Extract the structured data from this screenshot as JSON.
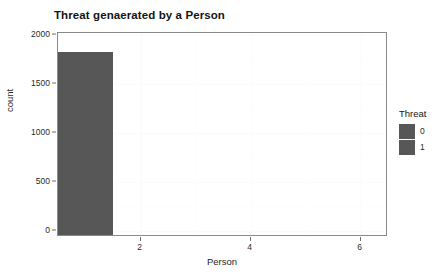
{
  "chart_data": {
    "type": "bar",
    "title": "Threat genaerated by a Person",
    "xlabel": "Person",
    "ylabel": "count",
    "xlim": [
      0.5,
      6.5
    ],
    "ylim": [
      0,
      2000
    ],
    "grid": true,
    "legend_position": "right",
    "legend_title": "Threat",
    "x_ticks": [
      "2",
      "4",
      "6"
    ],
    "x_tick_values": [
      2,
      4,
      6
    ],
    "y_ticks": [
      "0",
      "500",
      "1000",
      "1500",
      "2000"
    ],
    "y_tick_values": [
      0,
      500,
      1000,
      1500,
      2000
    ],
    "categories": [
      1,
      2,
      3,
      4,
      5,
      6
    ],
    "series": [
      {
        "name": "0",
        "color": "#575757",
        "values": [
          1930,
          50,
          0,
          0,
          0,
          8
        ]
      },
      {
        "name": "1",
        "color": "#575757",
        "values": [
          0,
          0,
          0,
          0,
          0,
          0
        ]
      }
    ],
    "bars": [
      {
        "x_center": 1,
        "width": 1,
        "value": 1930,
        "color": "#575757",
        "faint": false
      },
      {
        "x_center": 2,
        "width": 1,
        "value": 50,
        "color": "#575757",
        "faint": false
      },
      {
        "x_center": 6,
        "width": 1,
        "value": 8,
        "color": "#9d9d9d",
        "faint": true
      }
    ],
    "legend_entries": [
      {
        "label": "0",
        "color": "#575757"
      },
      {
        "label": "1",
        "color": "#575757"
      }
    ]
  }
}
